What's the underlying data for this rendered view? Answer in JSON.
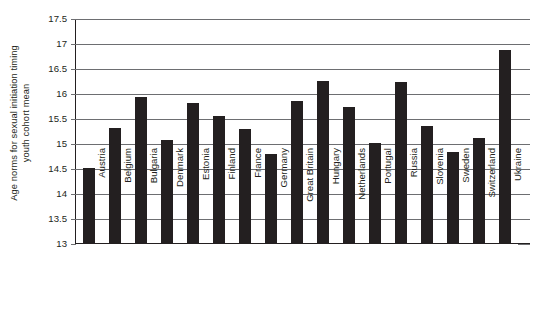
{
  "chart_data": {
    "type": "bar",
    "title": "",
    "xlabel": "",
    "ylabel": "Age norms for sexual initiation timing youth cohort mean",
    "ylabel_lines": [
      "Age norms for sexual initiation timing",
      "youth cohort mean"
    ],
    "ylim": [
      13,
      17.5
    ],
    "yticks": [
      13,
      13.5,
      14,
      14.5,
      15,
      15.5,
      16,
      16.5,
      17,
      17.5
    ],
    "ytick_labels": [
      "13",
      "13.5",
      "14",
      "14.5",
      "15",
      "15.5",
      "16",
      "16.5",
      "17",
      "17.5"
    ],
    "grid": true,
    "legend": false,
    "bar_color": "#231f20",
    "grid_color": "#6d6e71",
    "categories": [
      "Austria",
      "Belgium",
      "Bulgaria",
      "Denmark",
      "Estonia",
      "Finland",
      "France",
      "Germany",
      "Great Britain",
      "Hungary",
      "Netherlands",
      "Portugal",
      "Russia",
      "Slovenia",
      "Sweden",
      "Switzerland",
      "Ukraine"
    ],
    "values": [
      14.5,
      15.3,
      15.93,
      15.07,
      15.8,
      15.55,
      15.28,
      14.78,
      15.85,
      16.24,
      15.73,
      15.0,
      16.22,
      15.35,
      14.83,
      15.1,
      16.87
    ]
  }
}
